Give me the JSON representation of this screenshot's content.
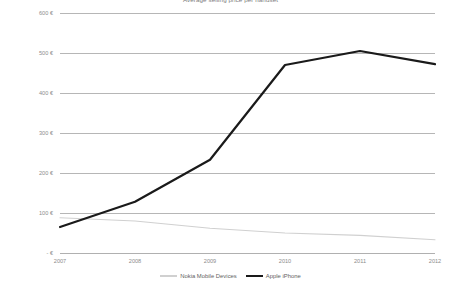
{
  "chart_data": {
    "type": "line",
    "title": "Average selling price per handset",
    "xlabel": "",
    "ylabel": "",
    "categories": [
      "2007",
      "2008",
      "2009",
      "2010",
      "2011",
      "2012"
    ],
    "ylim": [
      0,
      600
    ],
    "ytick_labels": [
      "600 €",
      "500 €",
      "400 €",
      "300 €",
      "200 €",
      "100 €",
      "- €"
    ],
    "ytick_values": [
      600,
      500,
      400,
      300,
      200,
      100,
      0
    ],
    "grid": true,
    "legend_position": "bottom",
    "series": [
      {
        "name": "Nokia Mobile Devices",
        "color": "#d0d0d0",
        "width": 1.1,
        "values": [
          88,
          80,
          62,
          50,
          44,
          33
        ]
      },
      {
        "name": "Apple iPhone",
        "color": "#1a1a1a",
        "width": 2.2,
        "values": [
          65,
          128,
          233,
          470,
          505,
          472
        ]
      }
    ]
  },
  "axis": {
    "y_labels": [
      "600 €",
      "500 €",
      "400 €",
      "300 €",
      "200 €",
      "100 €",
      "- €"
    ],
    "x_labels": [
      "2007",
      "2008",
      "2009",
      "2010",
      "2011",
      "2012"
    ]
  },
  "legend": {
    "items": [
      {
        "label": "Nokia Mobile Devices"
      },
      {
        "label": "Apple iPhone"
      }
    ]
  }
}
